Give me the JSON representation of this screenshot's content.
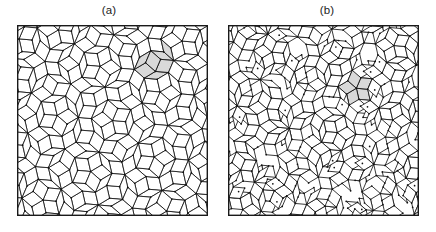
{
  "figure": {
    "background_color": "#ffffff",
    "width": 436,
    "height": 232
  },
  "panels": [
    {
      "id": "a",
      "label": "(a)",
      "caption_position": "above",
      "tiling_type": "ordered-penrose-rhombus",
      "description": "Perfect quasiperiodic Penrose rhombus tiling with tenfold symmetric decagonal flower motifs",
      "frame": {
        "x": 17,
        "y": 25,
        "width": 191,
        "height": 191
      },
      "highlight": {
        "shape": "decagon-cluster",
        "center_x": 141,
        "center_y": 37,
        "radius": 17,
        "fill_color": "#d9d9d9",
        "label": "highlighted decagonal cluster"
      },
      "generator": {
        "method": "de-bruijn-pentagrid",
        "symmetry": 5,
        "randomness": 0.0,
        "scale": 13.1,
        "offsets": [
          0.21,
          0.17,
          0.19,
          0.23,
          0.2
        ]
      }
    },
    {
      "id": "b",
      "label": "(b)",
      "caption_position": "above",
      "tiling_type": "random-rhombus",
      "description": "Random rhombus tiling with disordered vertex environments and fewer perfect decagonal motifs",
      "frame": {
        "x": 10,
        "y": 25,
        "width": 191,
        "height": 191
      },
      "highlight": {
        "shape": "decagon-cluster",
        "center_x": 128,
        "center_y": 65,
        "radius": 12,
        "fill_color": "#d9d9d9",
        "label": "highlighted decagonal cluster"
      },
      "generator": {
        "method": "de-bruijn-pentagrid-randomized",
        "symmetry": 5,
        "randomness": 0.62,
        "scale": 11.4,
        "offsets": [
          0.13,
          0.41,
          0.77,
          0.29,
          0.58
        ]
      }
    }
  ],
  "style": {
    "line_color": "#151515",
    "frame_color": "#1a1a1a",
    "tile_fill": "#ffffff",
    "highlight_fill": "#d9d9d9",
    "vertex_color": "#101010",
    "label_color": "#1c1c1c",
    "label_font_size": "11.5px"
  }
}
